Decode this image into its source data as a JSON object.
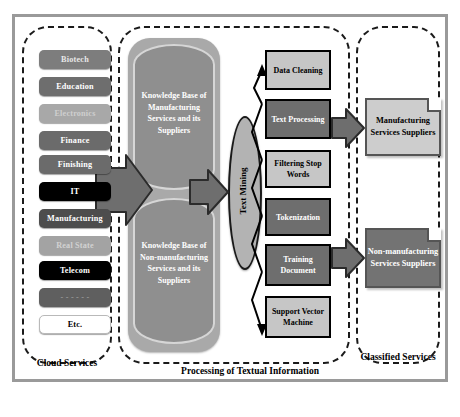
{
  "diagram": {
    "groups": [
      {
        "id": "cloud",
        "caption": "Cloud Services"
      },
      {
        "id": "processing",
        "caption": "Processing of Textual Information"
      },
      {
        "id": "classified",
        "caption": "Classified Services"
      }
    ],
    "cloud_services": [
      {
        "label": "Biotech",
        "fill": "#7d7d7d",
        "text": "#e8e8e8",
        "style": "light"
      },
      {
        "label": "Education",
        "fill": "#6e6e6e",
        "text": "#ffffff",
        "style": "normal"
      },
      {
        "label": "Electronics",
        "fill": "#a8a8a8",
        "text": "#cfcfcf",
        "style": "light"
      },
      {
        "label": "Finance",
        "fill": "#6b6b6b",
        "text": "#ffffff",
        "style": "normal"
      },
      {
        "label": "Finishing",
        "fill": "#6b6b6b",
        "text": "#ffffff",
        "style": "normal"
      },
      {
        "label": "IT",
        "fill": "#000000",
        "text": "#ffffff",
        "style": "normal"
      },
      {
        "label": "Manufacturing",
        "fill": "#4d4d4d",
        "text": "#ffffff",
        "style": "normal"
      },
      {
        "label": "Real State",
        "fill": "#a3a3a3",
        "text": "#d2d2d2",
        "style": "light"
      },
      {
        "label": "Telecom",
        "fill": "#000000",
        "text": "#ffffff",
        "style": "normal"
      },
      {
        "label": "- - - - - -",
        "fill": "#5f5f5f",
        "text": "#9c9c9c",
        "style": "light"
      },
      {
        "label": "Etc.",
        "fill": "#ffffff",
        "text": "#000000",
        "style": "white"
      }
    ],
    "knowledge_bases": [
      {
        "label": "Knowledge Base of Manufacturing Services and its Suppliers"
      },
      {
        "label": "Knowledge Base of Non-manufacturing Services and its Suppliers"
      }
    ],
    "text_mining": {
      "label": "Text Mining"
    },
    "pipeline_steps": [
      {
        "label": "Data Cleaning",
        "shade": "light"
      },
      {
        "label": "Text Processing",
        "shade": "dark"
      },
      {
        "label": "Filtering Stop Words",
        "shade": "light"
      },
      {
        "label": "Tokenization",
        "shade": "dark"
      },
      {
        "label": "Training Document",
        "shade": "dark"
      },
      {
        "label": "Support Vector Machine",
        "shade": "light"
      }
    ],
    "outputs": [
      {
        "label": "Manufacturing Services Suppliers",
        "shade": "light"
      },
      {
        "label": "Non-manufacturing Services Suppliers",
        "shade": "dark"
      }
    ],
    "colors": {
      "frame": "#9a9a9a",
      "dashed": "#1a1a1a",
      "arrow_fill": "#6e6e6e",
      "arrow_stroke": "#2b2b2b",
      "panel": "#a9a9a9",
      "cylinder": "#8f8f8f"
    }
  }
}
